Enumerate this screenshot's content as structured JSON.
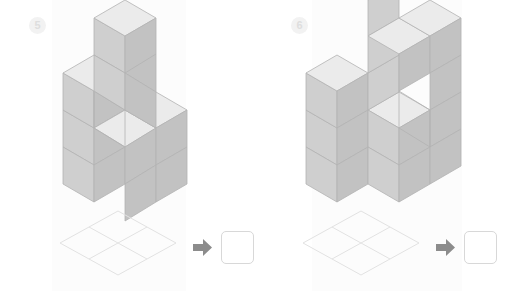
{
  "worksheet": {
    "title": "Isometric cube counting exercise",
    "background_color": "#ffffff",
    "panel_tint_color": "#fcfcfc"
  },
  "palette": {
    "cube_top": "#ebebeb",
    "cube_left": "#cfcfcf",
    "cube_right": "#c2c2c2",
    "cube_edge": "#b3b3b3",
    "grid_stroke": "#e2e2e2",
    "arrow_fill": "#8c8c8c",
    "badge_bg": "#f2f2f2",
    "badge_text": "#dedede",
    "answer_box_border": "#d8d8d8",
    "answer_box_fill": "#ffffff"
  },
  "panels": [
    {
      "id": "panel-5",
      "badge_label": "5",
      "figure_name": "isometric-cube-stack-5",
      "base_grid": {
        "name": "isometric-base-grid",
        "rows": 2,
        "cols": 2,
        "cells": 4
      },
      "arrow": {
        "icon": "arrow-right-icon",
        "label": "→"
      },
      "answer_box": {
        "name": "answer-box",
        "value": "",
        "placeholder": ""
      },
      "cubes": [
        {
          "x": 0,
          "y": 0,
          "z": 0
        },
        {
          "x": 1,
          "y": 0,
          "z": 0
        },
        {
          "x": 0,
          "y": 1,
          "z": 0
        },
        {
          "x": 1,
          "y": 1,
          "z": 0
        },
        {
          "x": 0,
          "y": 0,
          "z": 1
        },
        {
          "x": 1,
          "y": 0,
          "z": 1
        },
        {
          "x": 0,
          "y": 1,
          "z": 1
        },
        {
          "x": 1,
          "y": 1,
          "z": 1
        },
        {
          "x": 0,
          "y": 0,
          "z": 2
        },
        {
          "x": 1,
          "y": 0,
          "z": 2
        },
        {
          "x": 0,
          "y": 0,
          "z": 3
        },
        {
          "x": 1,
          "y": 0,
          "z": 3
        },
        {
          "x": 1,
          "y": 0,
          "z": 4
        }
      ],
      "cube_count": 13
    },
    {
      "id": "panel-6",
      "badge_label": "6",
      "figure_name": "isometric-cube-stack-6",
      "base_grid": {
        "name": "isometric-base-grid",
        "rows": 2,
        "cols": 2,
        "cells": 4
      },
      "arrow": {
        "icon": "arrow-right-icon",
        "label": "→"
      },
      "answer_box": {
        "name": "answer-box",
        "value": "",
        "placeholder": ""
      },
      "cubes": [
        {
          "x": 0,
          "y": 0,
          "z": 0
        },
        {
          "x": 1,
          "y": 0,
          "z": 0
        },
        {
          "x": 0,
          "y": 1,
          "z": 0
        },
        {
          "x": 1,
          "y": 1,
          "z": 0
        },
        {
          "x": 0,
          "y": 0,
          "z": 1
        },
        {
          "x": 1,
          "y": 0,
          "z": 1
        },
        {
          "x": 0,
          "y": 1,
          "z": 1
        },
        {
          "x": 1,
          "y": 1,
          "z": 1
        },
        {
          "x": 0,
          "y": 1,
          "z": 2
        },
        {
          "x": 1,
          "y": 0,
          "z": 2
        },
        {
          "x": 1,
          "y": 1,
          "z": 2
        },
        {
          "x": 0,
          "y": 1,
          "z": 3
        },
        {
          "x": 1,
          "y": 0,
          "z": 3
        },
        {
          "x": 1,
          "y": 1,
          "z": 3
        },
        {
          "x": 1,
          "y": 0,
          "z": 4
        },
        {
          "x": 1,
          "y": 1,
          "z": 4
        }
      ],
      "cube_count": 16
    }
  ]
}
